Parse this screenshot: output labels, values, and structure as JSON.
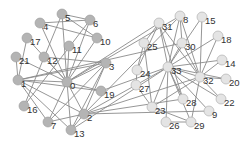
{
  "graph": {
    "colors": {
      "group_a": "#b4b4b4",
      "group_b": "#e4e4e4",
      "edge": "#8a8a8a",
      "label": "#333333"
    },
    "nodes": [
      {
        "id": "0",
        "x": 67,
        "y": 82,
        "group": "a"
      },
      {
        "id": "1",
        "x": 18,
        "y": 80,
        "group": "a"
      },
      {
        "id": "2",
        "x": 84,
        "y": 114,
        "group": "a"
      },
      {
        "id": "3",
        "x": 106,
        "y": 63,
        "group": "a"
      },
      {
        "id": "4",
        "x": 40,
        "y": 23,
        "group": "a"
      },
      {
        "id": "5",
        "x": 62,
        "y": 14,
        "group": "a"
      },
      {
        "id": "6",
        "x": 90,
        "y": 20,
        "group": "a"
      },
      {
        "id": "7",
        "x": 48,
        "y": 122,
        "group": "a"
      },
      {
        "id": "8",
        "x": 180,
        "y": 16,
        "group": "b"
      },
      {
        "id": "9",
        "x": 209,
        "y": 111,
        "group": "b"
      },
      {
        "id": "10",
        "x": 97,
        "y": 38,
        "group": "a"
      },
      {
        "id": "11",
        "x": 69,
        "y": 46,
        "group": "a"
      },
      {
        "id": "12",
        "x": 44,
        "y": 57,
        "group": "a"
      },
      {
        "id": "13",
        "x": 71,
        "y": 130,
        "group": "a"
      },
      {
        "id": "14",
        "x": 222,
        "y": 60,
        "group": "b"
      },
      {
        "id": "15",
        "x": 202,
        "y": 17,
        "group": "b"
      },
      {
        "id": "16",
        "x": 24,
        "y": 106,
        "group": "a"
      },
      {
        "id": "17",
        "x": 27,
        "y": 38,
        "group": "a"
      },
      {
        "id": "18",
        "x": 218,
        "y": 36,
        "group": "b"
      },
      {
        "id": "19",
        "x": 101,
        "y": 91,
        "group": "a"
      },
      {
        "id": "20",
        "x": 226,
        "y": 79,
        "group": "b"
      },
      {
        "id": "21",
        "x": 16,
        "y": 57,
        "group": "a"
      },
      {
        "id": "22",
        "x": 221,
        "y": 99,
        "group": "b"
      },
      {
        "id": "23",
        "x": 152,
        "y": 107,
        "group": "b"
      },
      {
        "id": "24",
        "x": 137,
        "y": 70,
        "group": "b"
      },
      {
        "id": "25",
        "x": 144,
        "y": 43,
        "group": "b"
      },
      {
        "id": "26",
        "x": 166,
        "y": 122,
        "group": "b"
      },
      {
        "id": "27",
        "x": 136,
        "y": 85,
        "group": "b"
      },
      {
        "id": "28",
        "x": 183,
        "y": 99,
        "group": "b"
      },
      {
        "id": "29",
        "x": 191,
        "y": 122,
        "group": "b"
      },
      {
        "id": "30",
        "x": 182,
        "y": 43,
        "group": "b"
      },
      {
        "id": "31",
        "x": 159,
        "y": 23,
        "group": "b"
      },
      {
        "id": "32",
        "x": 200,
        "y": 77,
        "group": "b"
      },
      {
        "id": "33",
        "x": 168,
        "y": 67,
        "group": "b"
      }
    ],
    "edges": [
      [
        0,
        1
      ],
      [
        0,
        2
      ],
      [
        0,
        3
      ],
      [
        0,
        4
      ],
      [
        0,
        5
      ],
      [
        0,
        6
      ],
      [
        0,
        7
      ],
      [
        0,
        8
      ],
      [
        0,
        10
      ],
      [
        0,
        11
      ],
      [
        0,
        12
      ],
      [
        0,
        13
      ],
      [
        0,
        17
      ],
      [
        0,
        19
      ],
      [
        0,
        21
      ],
      [
        0,
        31
      ],
      [
        1,
        2
      ],
      [
        1,
        3
      ],
      [
        1,
        7
      ],
      [
        1,
        13
      ],
      [
        1,
        17
      ],
      [
        1,
        19
      ],
      [
        1,
        21
      ],
      [
        1,
        30
      ],
      [
        2,
        3
      ],
      [
        2,
        7
      ],
      [
        2,
        8
      ],
      [
        2,
        9
      ],
      [
        2,
        13
      ],
      [
        2,
        27
      ],
      [
        2,
        28
      ],
      [
        2,
        32
      ],
      [
        3,
        7
      ],
      [
        3,
        12
      ],
      [
        3,
        13
      ],
      [
        4,
        6
      ],
      [
        4,
        10
      ],
      [
        5,
        6
      ],
      [
        5,
        10
      ],
      [
        5,
        16
      ],
      [
        6,
        16
      ],
      [
        8,
        30
      ],
      [
        8,
        32
      ],
      [
        8,
        33
      ],
      [
        9,
        33
      ],
      [
        13,
        33
      ],
      [
        14,
        32
      ],
      [
        14,
        33
      ],
      [
        15,
        32
      ],
      [
        15,
        33
      ],
      [
        18,
        32
      ],
      [
        18,
        33
      ],
      [
        19,
        33
      ],
      [
        20,
        32
      ],
      [
        20,
        33
      ],
      [
        22,
        32
      ],
      [
        22,
        33
      ],
      [
        23,
        25
      ],
      [
        23,
        27
      ],
      [
        23,
        29
      ],
      [
        23,
        32
      ],
      [
        23,
        33
      ],
      [
        24,
        25
      ],
      [
        24,
        27
      ],
      [
        24,
        31
      ],
      [
        25,
        31
      ],
      [
        26,
        29
      ],
      [
        26,
        33
      ],
      [
        27,
        33
      ],
      [
        28,
        31
      ],
      [
        28,
        33
      ],
      [
        29,
        32
      ],
      [
        29,
        33
      ],
      [
        30,
        32
      ],
      [
        30,
        33
      ],
      [
        31,
        32
      ],
      [
        31,
        33
      ],
      [
        32,
        33
      ]
    ]
  }
}
